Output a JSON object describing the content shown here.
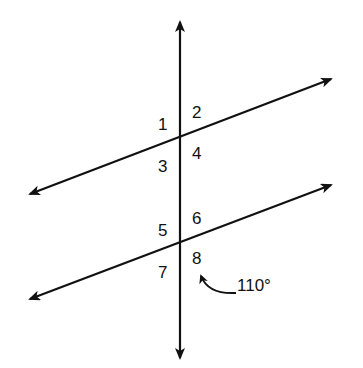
{
  "diagram": {
    "colors": {
      "stroke": "#111111",
      "background": "#ffffff"
    },
    "angle_labels": [
      {
        "id": "1",
        "text": "1"
      },
      {
        "id": "2",
        "text": "2"
      },
      {
        "id": "3",
        "text": "3"
      },
      {
        "id": "4",
        "text": "4"
      },
      {
        "id": "5",
        "text": "5"
      },
      {
        "id": "6",
        "text": "6"
      },
      {
        "id": "7",
        "text": "7"
      },
      {
        "id": "8",
        "text": "8"
      }
    ],
    "annotation": {
      "text": "110°",
      "points_to": "angle 8"
    }
  }
}
